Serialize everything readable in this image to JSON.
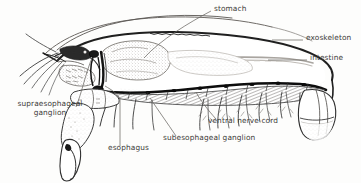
{
  "figure": {
    "background_color": "#fdfdfc",
    "ink_color": "#2b2b2b",
    "label_color": "#3c3a38",
    "width": 361,
    "height": 183
  },
  "labels": [
    {
      "id": "stomach",
      "text": "stomach",
      "x": 214,
      "y": 9,
      "align": "left",
      "leader": "line-from-text-down-left-to-stomach-mass"
    },
    {
      "id": "exoskeleton",
      "text": "exoskeleton",
      "x": 306,
      "y": 38,
      "align": "left",
      "leader": "short-dash-left-to-carapace-outline"
    },
    {
      "id": "intestine",
      "text": "intestine",
      "x": 310,
      "y": 58,
      "align": "left",
      "leader": "short-dash-left-to-intestine-line"
    },
    {
      "id": "supraesophageal-ganglion",
      "text": "supraesophageal\nganglion",
      "x": 4,
      "y": 104,
      "align": "left",
      "leader": "line-up-right-to-brain"
    },
    {
      "id": "esophagus",
      "text": "esophagus",
      "x": 108,
      "y": 148,
      "align": "left",
      "leader": "vertical-line-up-to-esophagus-tube"
    },
    {
      "id": "subesophageal-ganglion",
      "text": "subesophageal ganglion",
      "x": 163,
      "y": 138,
      "align": "left",
      "leader": "line-up-left-to-subesophageal-ganglion"
    },
    {
      "id": "ventral-nerve-cord",
      "text": "ventral nerve cord",
      "x": 208,
      "y": 121,
      "align": "left",
      "leader": "line-up-left-to-nerve-cord"
    }
  ]
}
